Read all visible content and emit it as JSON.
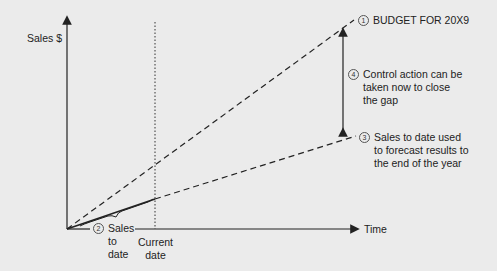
{
  "diagram": {
    "y_axis_label": "Sales $",
    "x_axis_label": "Time",
    "annotations": [
      {
        "num": "1",
        "text": "BUDGET FOR 20X9"
      },
      {
        "num": "2",
        "lines": [
          "Sales",
          "to",
          "date"
        ]
      },
      {
        "num": "3",
        "lines": [
          "Sales to date used",
          "to forecast results to",
          "the end of the year"
        ]
      },
      {
        "num": "4",
        "lines": [
          "Control action can be",
          "taken now to close",
          "the gap"
        ]
      }
    ],
    "current_date_label": [
      "Current",
      "date"
    ],
    "colors": {
      "background": "#ebebeb",
      "line": "#222222"
    }
  }
}
